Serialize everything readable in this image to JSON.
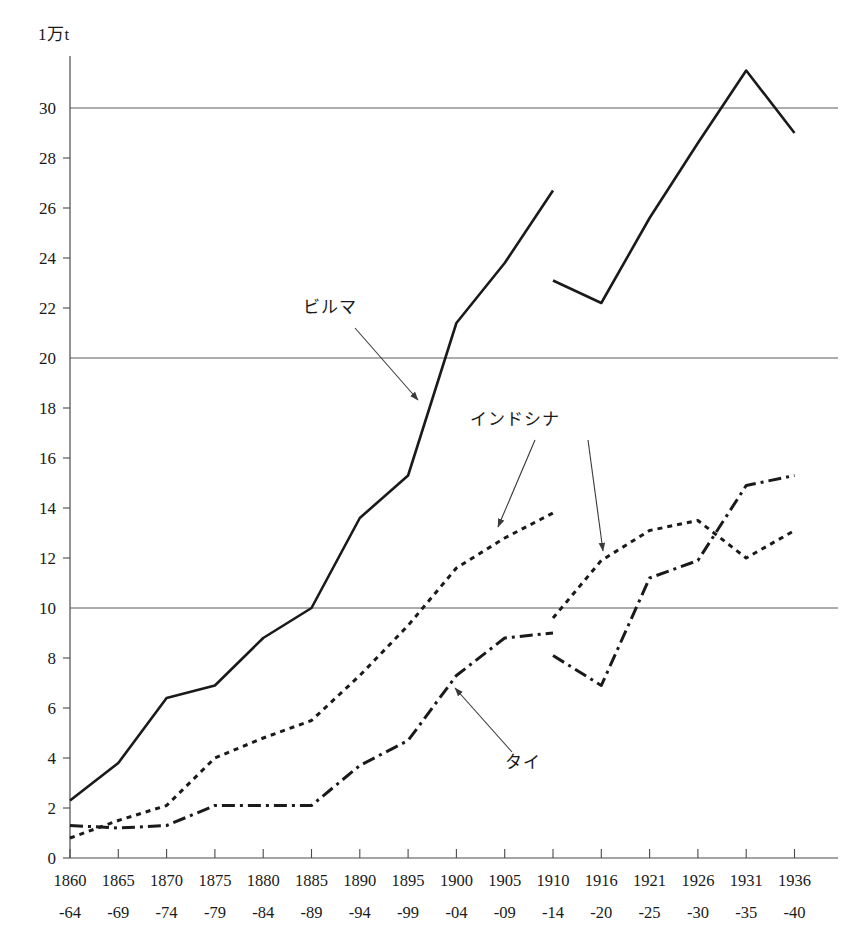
{
  "chart_data": {
    "type": "line",
    "title": "",
    "unit_label": "1万t",
    "ylabel": "",
    "xlabel": "",
    "ylim": [
      0,
      32
    ],
    "ytick_values": [
      0,
      2,
      4,
      6,
      8,
      10,
      12,
      14,
      16,
      18,
      20,
      22,
      24,
      26,
      28,
      30
    ],
    "ytick_labels": [
      "0",
      "2",
      "4",
      "6",
      "8",
      "10",
      "12",
      "14",
      "16",
      "18",
      "20",
      "22",
      "24",
      "26",
      "28",
      "30"
    ],
    "gridlines": [
      10,
      20,
      30
    ],
    "grid": true,
    "legend_position": "annotations",
    "categories": [
      "1860-64",
      "1865-69",
      "1870-74",
      "1875-79",
      "1880-84",
      "1885-89",
      "1890-94",
      "1895-99",
      "1900-04",
      "1905-09",
      "1910-14",
      "1916-20",
      "1921-25",
      "1926-30",
      "1931-35",
      "1936-40"
    ],
    "xtick_top_labels": [
      "1860",
      "1865",
      "1870",
      "1875",
      "1880",
      "1885",
      "1890",
      "1895",
      "1900",
      "1905",
      "1910",
      "1916",
      "1921",
      "1926",
      "1931",
      "1936"
    ],
    "xtick_bottom_labels": [
      "-64",
      "-69",
      "-74",
      "-79",
      "-84",
      "-89",
      "-94",
      "-99",
      "-04",
      "-09",
      "-14",
      "-20",
      "-25",
      "-30",
      "-35",
      "-40"
    ],
    "series": [
      {
        "name": "ビルマ",
        "style": "solid",
        "color": "#1a1a1a",
        "segments": [
          {
            "x_indices": [
              0,
              1,
              2,
              3,
              4,
              5,
              6,
              7,
              8,
              9,
              10
            ],
            "values": [
              2.3,
              3.8,
              6.4,
              6.9,
              8.8,
              10.0,
              13.6,
              15.3,
              21.4,
              23.8,
              26.7
            ]
          },
          {
            "x_indices": [
              10,
              11,
              12,
              13,
              14,
              15
            ],
            "values": [
              23.1,
              22.2,
              25.6,
              28.6,
              31.5,
              29.0
            ]
          }
        ]
      },
      {
        "name": "インドシナ",
        "style": "dotted",
        "color": "#1a1a1a",
        "segments": [
          {
            "x_indices": [
              0,
              1,
              2,
              3,
              4,
              5,
              6,
              7,
              8,
              9,
              10
            ],
            "values": [
              0.8,
              1.5,
              2.1,
              4.0,
              4.8,
              5.5,
              7.3,
              9.3,
              11.6,
              12.8,
              13.8
            ]
          },
          {
            "x_indices": [
              10,
              11,
              12,
              13,
              14,
              15
            ],
            "values": [
              9.6,
              11.9,
              13.1,
              13.5,
              12.0,
              13.1
            ]
          }
        ]
      },
      {
        "name": "タイ",
        "style": "dashdot",
        "color": "#1a1a1a",
        "segments": [
          {
            "x_indices": [
              0,
              1,
              2,
              3,
              4,
              5,
              6,
              7,
              8,
              9,
              10
            ],
            "values": [
              1.3,
              1.2,
              1.3,
              2.1,
              2.1,
              2.1,
              3.7,
              4.7,
              7.3,
              8.8,
              9.0
            ]
          },
          {
            "x_indices": [
              10,
              11,
              12,
              13,
              14,
              15
            ],
            "values": [
              8.1,
              6.9,
              11.2,
              11.9,
              14.9,
              15.3
            ]
          }
        ]
      }
    ],
    "annotations": [
      {
        "label": "ビルマ",
        "text_x": 330,
        "text_y": 313,
        "arrow_from_x": 355,
        "arrow_from_y": 328,
        "arrow_to_x": 418,
        "arrow_to_y": 400
      },
      {
        "label": "インドシナ",
        "text_x": 515,
        "text_y": 425,
        "arrow_from_x": 535,
        "arrow_from_y": 440,
        "arrow_to_x": 498,
        "arrow_to_y": 527
      },
      {
        "label": "",
        "text_x": 0,
        "text_y": 0,
        "arrow_from_x": 588,
        "arrow_from_y": 440,
        "arrow_to_x": 603,
        "arrow_to_y": 551
      },
      {
        "label": "タイ",
        "text_x": 523,
        "text_y": 768,
        "arrow_from_x": 512,
        "arrow_from_y": 752,
        "arrow_to_x": 455,
        "arrow_to_y": 688
      }
    ]
  }
}
